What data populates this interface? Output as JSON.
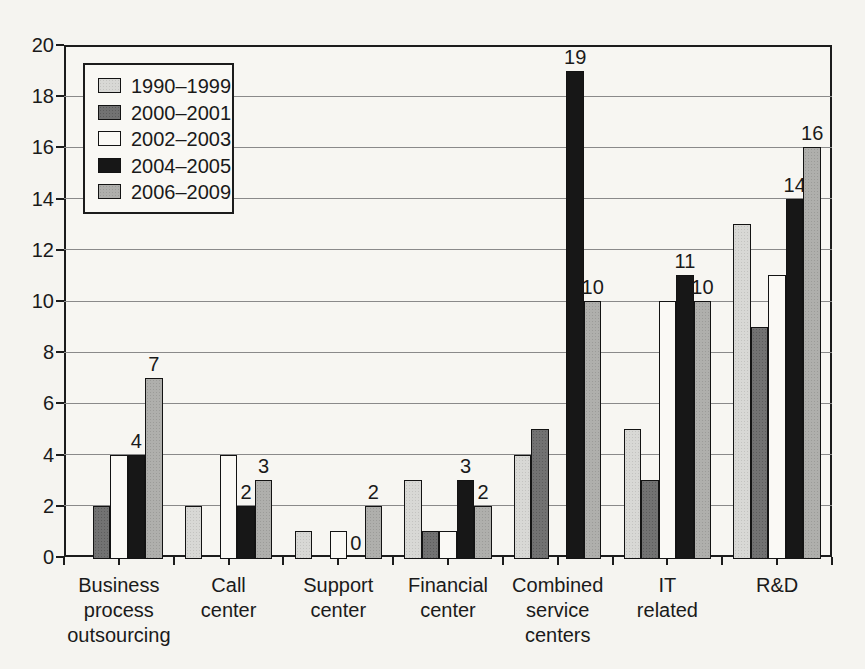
{
  "chart_data": {
    "type": "bar",
    "title": "",
    "xlabel": "",
    "ylabel": "",
    "ylim": [
      0,
      20
    ],
    "ytick_step": 2,
    "grid": true,
    "legend_position": "top-left",
    "categories": [
      "Business process outsourcing",
      "Call center",
      "Support center",
      "Financial center",
      "Combined service centers",
      "IT related",
      "R&D"
    ],
    "category_lines": [
      [
        "Business",
        "process",
        "outsourcing"
      ],
      [
        "Call",
        "center"
      ],
      [
        "Support",
        "center"
      ],
      [
        "Financial",
        "center"
      ],
      [
        "Combined",
        "service",
        "centers"
      ],
      [
        "IT",
        "related"
      ],
      [
        "R&D"
      ]
    ],
    "series": [
      {
        "name": "1990–1999",
        "color": "#d8d8d5",
        "show_value_labels": false,
        "values": [
          null,
          2,
          1,
          3,
          4,
          5,
          13
        ]
      },
      {
        "name": "2000–2001",
        "color": "#727272",
        "show_value_labels": false,
        "values": [
          2,
          null,
          null,
          1,
          5,
          3,
          9
        ]
      },
      {
        "name": "2002–2003",
        "color": "#faf9f5",
        "show_value_labels": false,
        "values": [
          4,
          4,
          1,
          1,
          null,
          10,
          11
        ]
      },
      {
        "name": "2004–2005",
        "color": "#171717",
        "show_value_labels": true,
        "values": [
          4,
          2,
          0,
          3,
          19,
          11,
          14
        ]
      },
      {
        "name": "2006–2009",
        "color": "#afafac",
        "show_value_labels": true,
        "values": [
          7,
          3,
          2,
          2,
          10,
          10,
          16
        ]
      }
    ],
    "visible_value_labels": [
      "4",
      "7",
      "2",
      "3",
      "0",
      "2",
      "3",
      "2",
      "19",
      "10",
      "11",
      "10",
      "14",
      "16"
    ],
    "colors": {
      "frame": "#1c1c1c",
      "gridline": "#8a8a8a",
      "paper": "#f5f4f0"
    }
  }
}
